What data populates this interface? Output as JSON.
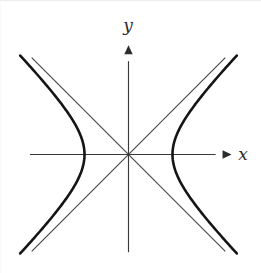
{
  "figure": {
    "title": "",
    "background_color": "#ffffff",
    "width": 261,
    "height": 273
  },
  "labels": {
    "x_axis": "x",
    "y_axis": "y"
  },
  "chart_data": {
    "type": "line",
    "title": "",
    "subtitle": "",
    "xlabel": "x",
    "ylabel": "y",
    "grid": false,
    "legend": false,
    "xlim": [
      -2.24,
      2.24
    ],
    "ylim": [
      -2.3,
      2.3
    ],
    "axes": {
      "x_axis": {
        "label": "x",
        "arrow": true,
        "from": [
          -2.24,
          0
        ],
        "to": [
          2.16,
          0
        ],
        "color": "#3a3a3a"
      },
      "y_axis": {
        "label": "y",
        "arrow": true,
        "from": [
          0,
          -2.22
        ],
        "to": [
          0,
          2.3
        ],
        "color": "#3a3a3a"
      }
    },
    "curve": {
      "name": "hyperbola",
      "equation": "x^2/a^2 - y^2/b^2 = 1",
      "a": 1,
      "b": 1,
      "center": [
        0,
        0
      ],
      "vertices": [
        [
          -1,
          0
        ],
        [
          1,
          0
        ]
      ],
      "color": "#151515",
      "line_width": 2.6,
      "branches": [
        {
          "name": "left-branch",
          "points": [
            [
              -2.2,
              -1.96
            ],
            [
              -1.9,
              -1.617
            ],
            [
              -1.6,
              -1.249
            ],
            [
              -1.35,
              -0.906
            ],
            [
              -1.18,
              -0.628
            ],
            [
              -1.06,
              -0.35
            ],
            [
              -1.0,
              0.0
            ],
            [
              -1.06,
              0.35
            ],
            [
              -1.18,
              0.628
            ],
            [
              -1.35,
              0.906
            ],
            [
              -1.6,
              1.249
            ],
            [
              -1.9,
              1.617
            ],
            [
              -2.2,
              1.96
            ]
          ]
        },
        {
          "name": "right-branch",
          "points": [
            [
              2.2,
              -1.96
            ],
            [
              1.9,
              -1.617
            ],
            [
              1.6,
              -1.249
            ],
            [
              1.35,
              -0.906
            ],
            [
              1.18,
              -0.628
            ],
            [
              1.06,
              -0.35
            ],
            [
              1.0,
              0.0
            ],
            [
              1.06,
              0.35
            ],
            [
              1.18,
              0.628
            ],
            [
              1.35,
              0.906
            ],
            [
              1.6,
              1.249
            ],
            [
              1.9,
              1.617
            ],
            [
              2.2,
              1.96
            ]
          ]
        }
      ]
    },
    "asymptotes": [
      {
        "name": "asymptote-positive-slope",
        "equation": "y = x",
        "slope": 1,
        "intercept": 0,
        "from": [
          -2.2,
          -2.2
        ],
        "to": [
          2.2,
          2.2
        ],
        "color": "#41413f",
        "line_width": 1.05
      },
      {
        "name": "asymptote-negative-slope",
        "equation": "y = -x",
        "slope": -1,
        "intercept": 0,
        "from": [
          -2.2,
          2.2
        ],
        "to": [
          2.2,
          -2.2
        ],
        "color": "#41413f",
        "line_width": 1.05
      }
    ],
    "colors": {
      "curve": "#151515",
      "asymptote": "#41413f",
      "axis": "#3a3a3a",
      "background": "#ffffff"
    }
  }
}
